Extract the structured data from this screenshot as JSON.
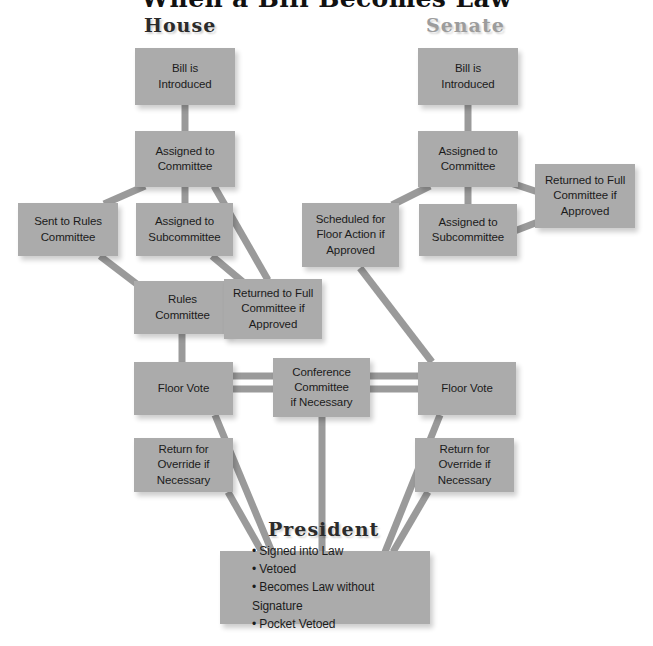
{
  "title": "When a Bill Becomes Law",
  "colors": {
    "box_fill": "#ababab",
    "connector": "#9a9a9a",
    "text": "#1b1b1b",
    "heading_dark": "#2b2b2b",
    "heading_light": "#9c9c9c",
    "background": "#ffffff"
  },
  "headings": {
    "house": "House",
    "senate": "Senate",
    "president": "President"
  },
  "nodes": {
    "house_bill_introduced": {
      "line1": "Bill is",
      "line2": "Introduced"
    },
    "house_assigned_committee": {
      "line1": "Assigned to",
      "line2": "Committee"
    },
    "house_sent_rules_committee": {
      "line1": "Sent to Rules",
      "line2": "Committee"
    },
    "house_assigned_subcommittee": {
      "line1": "Assigned to",
      "line2": "Subcommittee"
    },
    "house_rules_committee": {
      "line1": "Rules",
      "line2": "Committee"
    },
    "house_returned_full_committee": {
      "line1": "Returned to Full",
      "line2": "Committee if",
      "line3": "Approved"
    },
    "house_floor_vote": {
      "line1": "Floor Vote"
    },
    "house_return_override": {
      "line1": "Return for",
      "line2": "Override if",
      "line3": "Necessary"
    },
    "conference_committee": {
      "line1": "Conference",
      "line2": "Committee",
      "line3": "if Necessary"
    },
    "senate_bill_introduced": {
      "line1": "Bill is",
      "line2": "Introduced"
    },
    "senate_assigned_committee": {
      "line1": "Assigned to",
      "line2": "Committee"
    },
    "senate_assigned_subcommittee": {
      "line1": "Assigned to",
      "line2": "Subcommittee"
    },
    "senate_returned_full_committee": {
      "line1": "Returned to Full",
      "line2": "Committee if",
      "line3": "Approved"
    },
    "senate_scheduled_floor_action": {
      "line1": "Scheduled for",
      "line2": "Floor Action if",
      "line3": "Approved"
    },
    "senate_floor_vote": {
      "line1": "Floor Vote"
    },
    "senate_return_override": {
      "line1": "Return for",
      "line2": "Override if",
      "line3": "Necessary"
    },
    "president_outcomes": {
      "line1": "• Signed into Law",
      "line2": "• Vetoed",
      "line3": "• Becomes Law without Signature",
      "line4": "• Pocket Vetoed"
    }
  }
}
